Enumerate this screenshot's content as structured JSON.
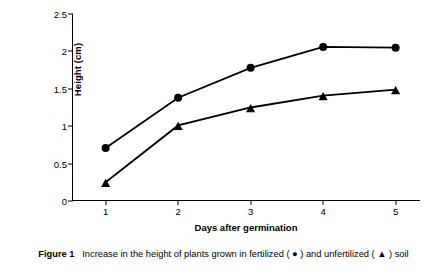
{
  "caption": {
    "prefix": "Figure 1",
    "text": "Increase in the height of plants grown in fertilized ( ● ) and unfertilized  ( ▲ ) soil"
  },
  "chart_data": {
    "type": "line",
    "title": "",
    "xlabel": "Days after germination",
    "ylabel": "Height (cm)",
    "x": [
      1,
      2,
      3,
      4,
      5
    ],
    "xticks": [
      "1",
      "2",
      "3",
      "4",
      "5"
    ],
    "yticks": [
      "0",
      "0.5",
      "1",
      "1.5",
      "2",
      "2.5"
    ],
    "ytickvalues": [
      0,
      0.5,
      1,
      1.5,
      2,
      2.5
    ],
    "xlim": [
      0.55,
      5.35
    ],
    "ylim": [
      0,
      2.5
    ],
    "grid": false,
    "legend": "in-caption",
    "series": [
      {
        "name": "fertilized",
        "marker": "circle",
        "symbol": "●",
        "color": "#000000",
        "values": [
          0.71,
          1.38,
          1.78,
          2.06,
          2.05
        ]
      },
      {
        "name": "unfertilized",
        "marker": "triangle",
        "symbol": "▲",
        "color": "#000000",
        "values": [
          0.25,
          1.01,
          1.25,
          1.41,
          1.49
        ]
      }
    ]
  }
}
